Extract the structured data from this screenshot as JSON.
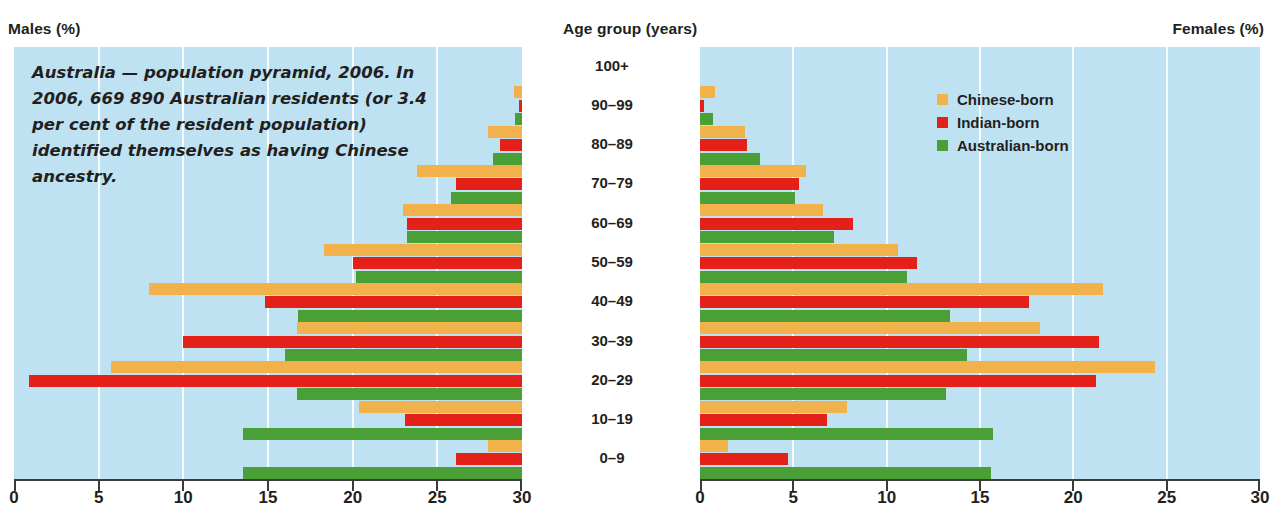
{
  "header": {
    "males_label": "Males (%)",
    "age_label": "Age group (years)",
    "females_label": "Females (%)"
  },
  "caption": "Australia — population pyramid, 2006. In 2006, 669 890 Australian residents (or 3.4 per cent of the resident population) identified themselves as having Chinese ancestry.",
  "legend": {
    "position": "top-right",
    "items": [
      {
        "label": "Chinese-born",
        "color": "#f2b24b"
      },
      {
        "label": "Indian-born",
        "color": "#e32119"
      },
      {
        "label": "Australian-born",
        "color": "#4a9f36"
      }
    ]
  },
  "colors": {
    "chinese": "#f2b24b",
    "indian": "#e32119",
    "australian": "#4a9f36",
    "panel_background": "#bfe2f2",
    "gridline": "#ffffff",
    "axis": "#3a3a3a",
    "text": "#231f20"
  },
  "chart_data": {
    "type": "bar",
    "title": "Australia — population pyramid, 2006",
    "subtitle": "Chinese-born, Indian-born and Australian-born population by age group and sex",
    "orientation": "horizontal",
    "layout": "population-pyramid",
    "xlabel_left": "Males (%)",
    "xlabel_right": "Females (%)",
    "ylabel": "Age group (years)",
    "categories": [
      "100+",
      "90–99",
      "80–89",
      "70–79",
      "60–69",
      "50–59",
      "40–49",
      "30–39",
      "20–29",
      "10–19",
      "0–9"
    ],
    "xlim_left": [
      30,
      0
    ],
    "xlim_right": [
      0,
      30
    ],
    "xticks_left": [
      30,
      25,
      20,
      15,
      10,
      5,
      0
    ],
    "xticks_right": [
      0,
      5,
      10,
      15,
      20,
      25,
      30
    ],
    "grid": true,
    "panels": [
      {
        "name": "males",
        "label": "Males (%)",
        "direction": "left",
        "series": [
          {
            "name": "Chinese-born",
            "color": "#f2b24b",
            "values": [
              0.0,
              0.5,
              2.0,
              6.2,
              7.0,
              11.7,
              22.0,
              13.3,
              24.3,
              9.6,
              2.0
            ]
          },
          {
            "name": "Indian-born",
            "color": "#e32119",
            "values": [
              0.0,
              0.2,
              1.3,
              3.9,
              6.8,
              10.0,
              15.2,
              20.0,
              29.1,
              6.9,
              3.9
            ]
          },
          {
            "name": "Australian-born",
            "color": "#4a9f36",
            "values": [
              0.0,
              0.4,
              1.7,
              4.2,
              6.8,
              9.8,
              13.2,
              14.0,
              13.3,
              16.5,
              16.5
            ]
          }
        ]
      },
      {
        "name": "females",
        "label": "Females (%)",
        "direction": "right",
        "series": [
          {
            "name": "Chinese-born",
            "color": "#f2b24b",
            "values": [
              0.0,
              0.8,
              2.4,
              5.7,
              6.6,
              10.6,
              21.6,
              18.2,
              24.4,
              7.9,
              1.5
            ]
          },
          {
            "name": "Indian-born",
            "color": "#e32119",
            "values": [
              0.0,
              0.2,
              2.5,
              5.3,
              8.2,
              11.6,
              17.6,
              21.4,
              21.2,
              6.8,
              4.7
            ]
          },
          {
            "name": "Australian-born",
            "color": "#4a9f36",
            "values": [
              0.0,
              0.7,
              3.2,
              5.1,
              7.2,
              11.1,
              13.4,
              14.3,
              13.2,
              15.7,
              15.6
            ]
          }
        ]
      }
    ]
  }
}
